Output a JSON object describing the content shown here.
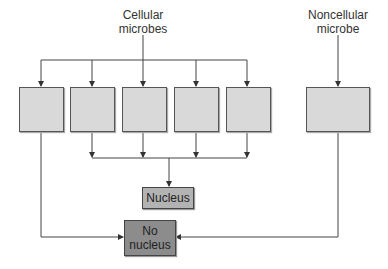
{
  "labels": {
    "cellular": "Cellular microbes",
    "noncellular": "Noncellular microbe",
    "nucleus": "Nucleus",
    "no_nucleus": "No nucleus"
  },
  "colors": {
    "box_fill": "#d9d9d9",
    "nucleus_fill": "#b3b3b3",
    "no_nucleus_fill": "#8c8c8c",
    "line": "#444444"
  }
}
